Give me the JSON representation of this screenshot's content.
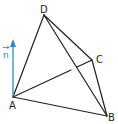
{
  "diagram": {
    "type": "tetrahedron",
    "vertices": {
      "A": {
        "label": "A",
        "x": 13,
        "y": 97
      },
      "B": {
        "label": "B",
        "x": 107,
        "y": 116
      },
      "C": {
        "label": "C",
        "x": 92,
        "y": 60
      },
      "D": {
        "label": "D",
        "x": 44,
        "y": 15
      }
    },
    "edges": [
      "AB",
      "AD",
      "DB",
      "DC",
      "CB",
      "AC"
    ],
    "hidden_edge_gap": "AC crosses behind DB",
    "normal_vector": {
      "label": "n",
      "arrow_mark": "→",
      "from": "A",
      "direction": "up"
    },
    "colors": {
      "edges": "#231f20",
      "vector": "#2e8bc0"
    }
  }
}
